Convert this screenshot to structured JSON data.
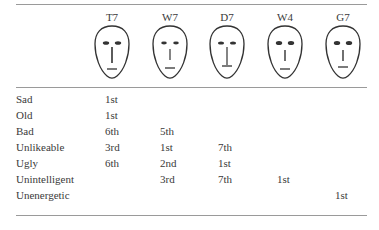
{
  "table": {
    "columns": [
      {
        "id": "T7",
        "label": "T7",
        "x": 112,
        "face": {
          "eye_rx": 3.2,
          "eye_ry": 1.8,
          "nose_top": 23,
          "nose_bottom": 39,
          "nose_w": 1.6,
          "mouth_y": 45,
          "mouth_half": 5
        }
      },
      {
        "id": "W7",
        "label": "W7",
        "x": 170,
        "face": {
          "eye_rx": 2.8,
          "eye_ry": 1.4,
          "nose_top": 25,
          "nose_bottom": 36,
          "nose_w": 1.2,
          "mouth_y": 44,
          "mouth_half": 5
        }
      },
      {
        "id": "D7",
        "label": "D7",
        "x": 227,
        "face": {
          "eye_rx": 3.0,
          "eye_ry": 1.6,
          "nose_top": 23,
          "nose_bottom": 41,
          "nose_w": 1.2,
          "mouth_y": 42,
          "mouth_half": 5
        }
      },
      {
        "id": "W4",
        "label": "W4",
        "x": 285,
        "face": {
          "eye_rx": 3.2,
          "eye_ry": 2.0,
          "nose_top": 26,
          "nose_bottom": 37,
          "nose_w": 1.4,
          "mouth_y": 45,
          "mouth_half": 5
        }
      },
      {
        "id": "G7",
        "label": "G7",
        "x": 343,
        "face": {
          "eye_rx": 3.2,
          "eye_ry": 2.0,
          "nose_top": 26,
          "nose_bottom": 37,
          "nose_w": 1.4,
          "mouth_y": 43,
          "mouth_half": 5
        }
      }
    ],
    "value_x": [
      105,
      160,
      218,
      277,
      335
    ],
    "rows": [
      {
        "label": "Sad",
        "values": [
          "1st",
          "",
          "",
          "",
          ""
        ]
      },
      {
        "label": "Old",
        "values": [
          "1st",
          "",
          "",
          "",
          ""
        ]
      },
      {
        "label": "Bad",
        "values": [
          "6th",
          "5th",
          "",
          "",
          ""
        ]
      },
      {
        "label": "Unlikeable",
        "values": [
          "3rd",
          "1st",
          "7th",
          "",
          ""
        ]
      },
      {
        "label": "Ugly",
        "values": [
          "6th",
          "2nd",
          "1st",
          "",
          ""
        ]
      },
      {
        "label": "Unintelligent",
        "values": [
          "",
          "3rd",
          "7th",
          "1st",
          ""
        ]
      },
      {
        "label": "Unenergetic",
        "values": [
          "",
          "",
          "",
          "",
          "1st"
        ]
      }
    ],
    "row_top_start": 93,
    "row_step": 16
  },
  "colors": {
    "text": "#3a3a3a",
    "rule": "#9a9a9a",
    "face_stroke": "#333333"
  }
}
